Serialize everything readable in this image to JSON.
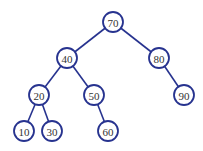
{
  "diagram": {
    "type": "binary-search-tree",
    "colors": {
      "stroke": "#27338f",
      "fill": "#ffffff",
      "text": "#333333"
    },
    "radius": 10,
    "nodes": [
      {
        "id": "n70",
        "label": "70",
        "x": 113,
        "y": 22
      },
      {
        "id": "n40",
        "label": "40",
        "x": 67,
        "y": 58
      },
      {
        "id": "n80",
        "label": "80",
        "x": 159,
        "y": 58
      },
      {
        "id": "n20",
        "label": "20",
        "x": 39,
        "y": 95
      },
      {
        "id": "n50",
        "label": "50",
        "x": 94,
        "y": 95
      },
      {
        "id": "n90",
        "label": "90",
        "x": 184,
        "y": 95
      },
      {
        "id": "n10",
        "label": "10",
        "x": 24,
        "y": 131
      },
      {
        "id": "n30",
        "label": "30",
        "x": 52,
        "y": 131
      },
      {
        "id": "n60",
        "label": "60",
        "x": 108,
        "y": 131
      }
    ],
    "edges": [
      {
        "from": "n70",
        "to": "n40"
      },
      {
        "from": "n70",
        "to": "n80"
      },
      {
        "from": "n40",
        "to": "n20"
      },
      {
        "from": "n40",
        "to": "n50"
      },
      {
        "from": "n80",
        "to": "n90"
      },
      {
        "from": "n20",
        "to": "n10"
      },
      {
        "from": "n20",
        "to": "n30"
      },
      {
        "from": "n50",
        "to": "n60"
      }
    ]
  }
}
